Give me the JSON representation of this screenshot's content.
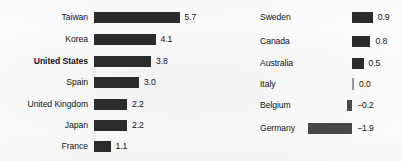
{
  "chart_data": {
    "type": "bar",
    "title": "",
    "subtitle": "",
    "xlabel": "",
    "ylabel": "",
    "grid": false,
    "legend": null,
    "orientation": "horizontal",
    "panels": [
      {
        "id": "left",
        "categories": [
          "Taiwan",
          "Korea",
          "United States",
          "Spain",
          "United Kingdom",
          "Japan",
          "France"
        ],
        "values": [
          5.7,
          4.1,
          3.8,
          3.0,
          2.2,
          2.2,
          1.1
        ],
        "value_labels": [
          "5.7",
          "4.1",
          "3.8",
          "3.0",
          "2.2",
          "2.2",
          "1.1"
        ],
        "emphasized": [
          "United States"
        ],
        "xlim": [
          0,
          5.7
        ]
      },
      {
        "id": "right",
        "categories": [
          "Sweden",
          "Canada",
          "Australia",
          "Italy",
          "Belgium",
          "Germany"
        ],
        "values": [
          0.9,
          0.8,
          0.5,
          0.0,
          -0.2,
          -1.9
        ],
        "value_labels": [
          "0.9",
          "0.8",
          "0.5",
          "0.0",
          "−0.2",
          "−1.9"
        ],
        "emphasized": [],
        "xlim": [
          -1.9,
          0.9
        ]
      }
    ],
    "colors": {
      "bar_positive": "#2d2d2d",
      "bar_negative": "#4a4a4a",
      "zero_tick": "#9b9b9b",
      "text": "#141414",
      "background": "#ffffff"
    }
  }
}
